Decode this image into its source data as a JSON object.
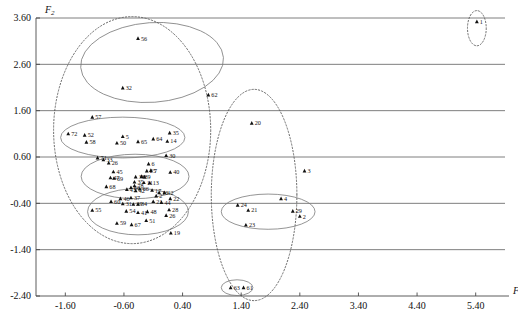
{
  "chart_data": {
    "type": "scatter",
    "title": "",
    "xlabel": "F1",
    "ylabel": "F2",
    "xlim": [
      -2.1,
      5.9
    ],
    "ylim": [
      -2.4,
      3.6
    ],
    "grid": true,
    "legend": "none",
    "x_ticks": [
      "-1.60",
      "-0.60",
      "0.40",
      "1.40",
      "2.40",
      "3.40",
      "4.40",
      "5.40"
    ],
    "x_tick_values": [
      -1.6,
      -0.6,
      0.4,
      1.4,
      2.4,
      3.4,
      4.4,
      5.4
    ],
    "y_ticks": [
      "3.60",
      "2.60",
      "1.60",
      "0.60",
      "-0.40",
      "-1.40",
      "-2.40"
    ],
    "y_tick_values": [
      3.6,
      2.6,
      1.6,
      0.6,
      -0.4,
      -1.4,
      -2.4
    ],
    "points": [
      {
        "label": "1",
        "x": 5.42,
        "y": 3.52
      },
      {
        "label": "56",
        "x": -0.36,
        "y": 3.16
      },
      {
        "label": "32",
        "x": -0.62,
        "y": 2.09
      },
      {
        "label": "62",
        "x": 0.84,
        "y": 1.94
      },
      {
        "label": "57",
        "x": -1.14,
        "y": 1.46
      },
      {
        "label": "20",
        "x": 1.58,
        "y": 1.33
      },
      {
        "label": "72",
        "x": -1.55,
        "y": 1.1
      },
      {
        "label": "52",
        "x": -1.27,
        "y": 1.07
      },
      {
        "label": "35",
        "x": 0.18,
        "y": 1.12
      },
      {
        "label": "5",
        "x": -0.62,
        "y": 1.04
      },
      {
        "label": "58",
        "x": -1.24,
        "y": 0.92
      },
      {
        "label": "14",
        "x": 0.14,
        "y": 0.94
      },
      {
        "label": "64",
        "x": -0.1,
        "y": 0.99
      },
      {
        "label": "65",
        "x": -0.36,
        "y": 0.93
      },
      {
        "label": "50",
        "x": -0.72,
        "y": 0.9
      },
      {
        "label": "30",
        "x": 0.12,
        "y": 0.63
      },
      {
        "label": "71",
        "x": -1.05,
        "y": 0.58
      },
      {
        "label": "33",
        "x": -0.95,
        "y": 0.54
      },
      {
        "label": "26",
        "x": -0.86,
        "y": 0.47
      },
      {
        "label": "6",
        "x": -0.18,
        "y": 0.45
      },
      {
        "label": "3",
        "x": 2.48,
        "y": 0.3
      },
      {
        "label": "7",
        "x": -0.14,
        "y": 0.31
      },
      {
        "label": "25",
        "x": -0.21,
        "y": 0.3
      },
      {
        "label": "40",
        "x": 0.19,
        "y": 0.27
      },
      {
        "label": "45",
        "x": -0.78,
        "y": 0.28
      },
      {
        "label": "38",
        "x": -0.4,
        "y": 0.17
      },
      {
        "label": "8",
        "x": -0.3,
        "y": 0.18
      },
      {
        "label": "9",
        "x": -0.25,
        "y": 0.17
      },
      {
        "label": "47",
        "x": -0.83,
        "y": 0.15
      },
      {
        "label": "69",
        "x": -0.77,
        "y": 0.14
      },
      {
        "label": "35b",
        "x": -0.42,
        "y": 0.06
      },
      {
        "label": "11",
        "x": -0.26,
        "y": 0.05
      },
      {
        "label": "13",
        "x": -0.16,
        "y": 0.04
      },
      {
        "label": "68",
        "x": -0.9,
        "y": -0.04
      },
      {
        "label": "66",
        "x": -0.48,
        "y": -0.06
      },
      {
        "label": "78",
        "x": -0.42,
        "y": -0.02
      },
      {
        "label": "43",
        "x": -0.55,
        "y": -0.1
      },
      {
        "label": "42",
        "x": -0.4,
        "y": -0.13
      },
      {
        "label": "66b",
        "x": -0.33,
        "y": -0.09
      },
      {
        "label": "17",
        "x": -0.12,
        "y": -0.12
      },
      {
        "label": "10",
        "x": 0.0,
        "y": -0.17
      },
      {
        "label": "12",
        "x": 0.09,
        "y": -0.17
      },
      {
        "label": "2b",
        "x": -0.05,
        "y": -0.24
      },
      {
        "label": "46",
        "x": -0.66,
        "y": -0.3
      },
      {
        "label": "37",
        "x": -0.48,
        "y": -0.28
      },
      {
        "label": "22",
        "x": 0.19,
        "y": -0.3
      },
      {
        "label": "60",
        "x": -0.82,
        "y": -0.36
      },
      {
        "label": "31",
        "x": -0.62,
        "y": -0.41
      },
      {
        "label": "39",
        "x": -0.44,
        "y": -0.42
      },
      {
        "label": "34",
        "x": -0.36,
        "y": -0.42
      },
      {
        "label": "21b",
        "x": -0.1,
        "y": -0.36
      },
      {
        "label": "44",
        "x": 0.04,
        "y": -0.38
      },
      {
        "label": "55",
        "x": -1.14,
        "y": -0.55
      },
      {
        "label": "54",
        "x": -0.56,
        "y": -0.57
      },
      {
        "label": "41",
        "x": -0.36,
        "y": -0.6
      },
      {
        "label": "48",
        "x": -0.2,
        "y": -0.58
      },
      {
        "label": "28",
        "x": 0.17,
        "y": -0.54
      },
      {
        "label": "26b",
        "x": 0.12,
        "y": -0.66
      },
      {
        "label": "59",
        "x": -0.72,
        "y": -0.83
      },
      {
        "label": "67",
        "x": -0.47,
        "y": -0.86
      },
      {
        "label": "51",
        "x": -0.22,
        "y": -0.77
      },
      {
        "label": "19",
        "x": 0.2,
        "y": -1.04
      },
      {
        "label": "4",
        "x": 2.08,
        "y": -0.3
      },
      {
        "label": "24",
        "x": 1.34,
        "y": -0.44
      },
      {
        "label": "21",
        "x": 1.52,
        "y": -0.55
      },
      {
        "label": "29",
        "x": 2.28,
        "y": -0.57
      },
      {
        "label": "2",
        "x": 2.4,
        "y": -0.68
      },
      {
        "label": "23",
        "x": 1.48,
        "y": -0.87
      },
      {
        "label": "63",
        "x": 1.22,
        "y": -2.22
      },
      {
        "label": "61",
        "x": 1.44,
        "y": -2.22
      }
    ],
    "ellipses": [
      {
        "name": "cluster-top-solid",
        "cx": -0.12,
        "cy": 2.64,
        "rx": 1.22,
        "ry": 0.86,
        "rot": -4,
        "style": "solid"
      },
      {
        "name": "cluster-upper-left-solid",
        "cx": -0.62,
        "cy": 1.02,
        "rx": 1.06,
        "ry": 0.44,
        "rot": 0,
        "style": "solid"
      },
      {
        "name": "cluster-middle-solid",
        "cx": -0.41,
        "cy": 0.18,
        "rx": 0.92,
        "ry": 0.48,
        "rot": 0,
        "style": "solid"
      },
      {
        "name": "cluster-lower-solid",
        "cx": -0.36,
        "cy": -0.58,
        "rx": 0.86,
        "ry": 0.5,
        "rot": 0,
        "style": "solid"
      },
      {
        "name": "cluster-right-solid",
        "cx": 1.86,
        "cy": -0.58,
        "rx": 0.8,
        "ry": 0.38,
        "rot": 0,
        "style": "solid"
      },
      {
        "name": "cluster-bottom-small-solid",
        "cx": 1.33,
        "cy": -2.22,
        "rx": 0.27,
        "ry": 0.17,
        "rot": 0,
        "style": "solid"
      },
      {
        "name": "group-left-dotted",
        "cx": -0.46,
        "cy": 1.18,
        "rx": 1.34,
        "ry": 2.45,
        "rot": 0,
        "style": "dotted"
      },
      {
        "name": "group-right-dotted",
        "cx": 1.62,
        "cy": -0.22,
        "rx": 0.73,
        "ry": 2.28,
        "rot": 0,
        "style": "dotted"
      },
      {
        "name": "group-point1-dotted",
        "cx": 5.42,
        "cy": 3.38,
        "rx": 0.16,
        "ry": 0.38,
        "rot": 0,
        "style": "dotted"
      }
    ]
  }
}
